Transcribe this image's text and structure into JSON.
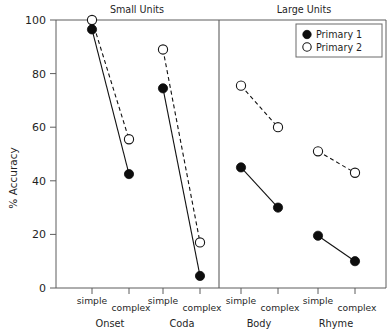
{
  "chart_data": {
    "type": "line",
    "title": "",
    "xlabel": "",
    "ylabel": "% Accuracy",
    "ylim": [
      0,
      100
    ],
    "yticks": [
      0,
      20,
      40,
      60,
      80,
      100
    ],
    "ytick_labels": [
      "0",
      "20",
      "40",
      "60",
      "80",
      "100"
    ],
    "grid": false,
    "legend_position": "top-right",
    "panels": [
      {
        "title": "Small Units"
      },
      {
        "title": "Large Units"
      }
    ],
    "groups": [
      {
        "name": "Onset",
        "panel": "Small Units"
      },
      {
        "name": "Coda",
        "panel": "Small Units"
      },
      {
        "name": "Body",
        "panel": "Large Units"
      },
      {
        "name": "Rhyme",
        "panel": "Large Units"
      }
    ],
    "categories": [
      "simple",
      "complex",
      "simple",
      "complex",
      "simple",
      "complex",
      "simple",
      "complex"
    ],
    "series": [
      {
        "name": "Primary 1",
        "marker": "filled-circle",
        "line": "solid",
        "color": "#0d0d0d",
        "values": [
          96.5,
          42.5,
          74.5,
          4.5,
          45.0,
          30.0,
          19.5,
          10.0
        ]
      },
      {
        "name": "Primary 2",
        "marker": "open-circle",
        "line": "dashed",
        "color": "#ffffff",
        "values": [
          100.0,
          55.5,
          89.0,
          17.0,
          75.5,
          60.0,
          51.0,
          43.0
        ]
      }
    ],
    "legend": [
      {
        "label": "Primary 1",
        "marker": "filled-circle"
      },
      {
        "label": "Primary 2",
        "marker": "open-circle"
      }
    ]
  }
}
